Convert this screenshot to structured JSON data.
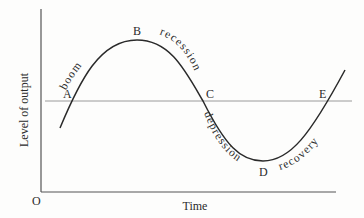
{
  "diagram": {
    "axes": {
      "y_label": "Level of output",
      "x_label": "Time",
      "origin_label": "O"
    },
    "points": [
      {
        "id": "A",
        "label": "A"
      },
      {
        "id": "B",
        "label": "B"
      },
      {
        "id": "C",
        "label": "C"
      },
      {
        "id": "D",
        "label": "D"
      },
      {
        "id": "E",
        "label": "E"
      }
    ],
    "phases": [
      {
        "id": "boom",
        "label": "boom"
      },
      {
        "id": "recession",
        "label": "recession"
      },
      {
        "id": "depression",
        "label": "depression"
      },
      {
        "id": "recovery",
        "label": "recovery"
      }
    ],
    "colors": {
      "curve": "#2a2a2a",
      "axis": "#555555",
      "trend_line": "#9a9a9a",
      "text": "#2b2b2b"
    }
  }
}
